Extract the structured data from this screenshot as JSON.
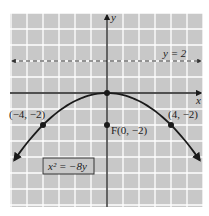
{
  "chart_data": {
    "type": "line",
    "title": "",
    "xlabel": "x",
    "ylabel": "y",
    "xlim": [
      -6,
      6
    ],
    "ylim": [
      -7,
      5
    ],
    "grid": true,
    "grid_step": 1,
    "colors": {
      "background": "#c8c8c8",
      "grid": "#ffffff",
      "curve": "#1a1a1a",
      "axis": "#1a1a1a"
    },
    "series": [
      {
        "name": "x^2 = -8y",
        "kind": "parabola",
        "equation": "y = -x^2/8",
        "x_range": [
          -5.8,
          5.8
        ],
        "style": "solid",
        "arrows": "both"
      },
      {
        "name": "y = 2",
        "kind": "directrix",
        "y": 2,
        "style": "dashed",
        "arrows": "both"
      }
    ],
    "points": [
      {
        "label": "(-4, -2)",
        "x": -4,
        "y": -2
      },
      {
        "label": "(4, -2)",
        "x": 4,
        "y": -2
      },
      {
        "label": "F(0, -2)",
        "x": 0,
        "y": -2
      },
      {
        "label": "",
        "x": 0,
        "y": 0
      }
    ],
    "annotations": {
      "directrix_label": "y = 2",
      "equation_box": "x² = −8y",
      "left_point": "(−4, −2)",
      "right_point": "(4, −2)",
      "focus": "F(0, −2)",
      "x_axis": "x",
      "y_axis": "y"
    }
  }
}
